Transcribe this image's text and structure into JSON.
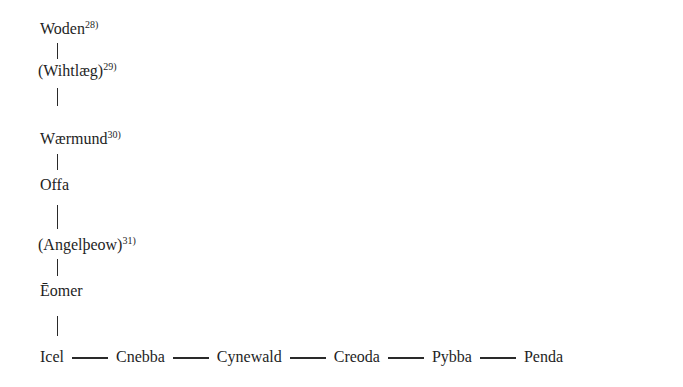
{
  "diagram": {
    "type": "genealogy",
    "vertical_lineage": [
      {
        "name": "Woden",
        "note": "28)"
      },
      {
        "name": "(Wihtlæg)",
        "note": "29)"
      },
      {
        "name": "Wærmund",
        "note": "30)"
      },
      {
        "name": "Offa",
        "note": ""
      },
      {
        "name": "(Angelþeow)",
        "note": "31)"
      },
      {
        "name": "Ēomer",
        "note": ""
      }
    ],
    "horizontal_lineage": [
      "Icel",
      "Cnebba",
      "Cynewald",
      "Creoda",
      "Pybba",
      "Penda"
    ],
    "line_color": "#2a2a2a",
    "text_color": "#1e1e1e"
  }
}
